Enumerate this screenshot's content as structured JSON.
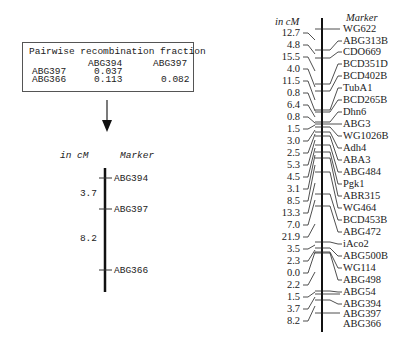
{
  "table": {
    "title": "Pairwise recombination fraction",
    "col_headers": [
      "ABG394",
      "ABG397"
    ],
    "rows": [
      {
        "label": "ABG397",
        "values": [
          "0.037",
          ""
        ]
      },
      {
        "label": "ABG366",
        "values": [
          "0.113",
          "0.082"
        ]
      }
    ]
  },
  "small_map": {
    "header_cm": "in cM",
    "header_marker": "Marker",
    "markers": [
      "ABG394",
      "ABG397",
      "ABG366"
    ],
    "distances": [
      "3.7",
      "8.2"
    ]
  },
  "large_map": {
    "header_cm": "in cM",
    "header_marker": "Marker",
    "markers": [
      "WG622",
      "ABG313B",
      "CDO669",
      "BCD351D",
      "BCD402B",
      "TubA1",
      "BCD265B",
      "Dhn6",
      "ABG3",
      "WG1026B",
      "Adh4",
      "ABA3",
      "ABG484",
      "Pgk1",
      "ABR315",
      "WG464",
      "BCD453B",
      "ABG472",
      "iAco2",
      "ABG500B",
      "WG114",
      "ABG498",
      "ABG54",
      "ABG394",
      "ABG397",
      "ABG366"
    ],
    "distances": [
      "12.7",
      "4.8",
      "15.5",
      "4.0",
      "11.5",
      "0.8",
      "6.4",
      "0.8",
      "1.5",
      "3.0",
      "2.5",
      "5.3",
      "4.5",
      "3.1",
      "8.5",
      "13.3",
      "7.0",
      "21.9",
      "3.5",
      "2.3",
      "0.0",
      "2.2",
      "1.5",
      "3.7",
      "8.2"
    ]
  },
  "arrow": {
    "direction": "down"
  }
}
